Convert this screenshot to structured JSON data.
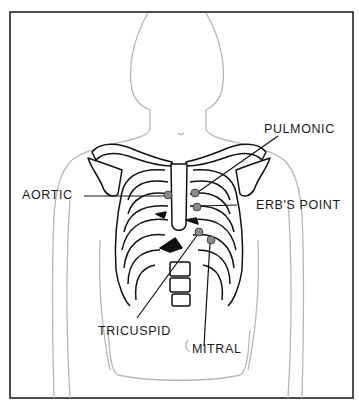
{
  "diagram": {
    "colors": {
      "border": "#222222",
      "body_outline": "#b8b8b8",
      "bone_stroke": "#111111",
      "dot_fill": "#8a8a8a",
      "label": "#1a1a1a"
    },
    "labels": {
      "pulmonic": "PULMONIC",
      "aortic": "AORTIC",
      "erbs_point": "ERB'S POINT",
      "tricuspid": "TRICUSPID",
      "mitral": "MITRAL"
    }
  }
}
